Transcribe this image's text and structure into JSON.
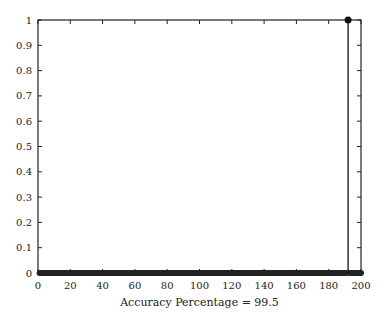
{
  "chart_data": {
    "type": "stem",
    "title": "",
    "xlabel": "Accuracy Percentage = 99.5",
    "ylabel": "",
    "xlim": [
      0,
      200
    ],
    "ylim": [
      0,
      1
    ],
    "xticks": [
      "0",
      "20",
      "40",
      "60",
      "80",
      "100",
      "120",
      "140",
      "160",
      "180",
      "200"
    ],
    "yticks": [
      "0",
      "0.1",
      "0.2",
      "0.3",
      "0.4",
      "0.5",
      "0.6",
      "0.7",
      "0.8",
      "0.9",
      "1"
    ],
    "grid": false,
    "series": [
      {
        "name": "errors",
        "description": "Stem plot: value 0 at all samples 1-200 except one sample with value 1",
        "nonzero_points": [
          {
            "x": 192,
            "y": 1
          }
        ],
        "zero_range": [
          1,
          200
        ]
      }
    ]
  },
  "axis": {
    "xlabel": "Accuracy Percentage = 99.5"
  }
}
